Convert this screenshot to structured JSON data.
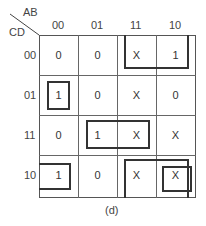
{
  "kmap": {
    "row_var": "CD",
    "col_var": "AB",
    "col_labels": [
      "00",
      "01",
      "11",
      "10"
    ],
    "row_labels": [
      "00",
      "01",
      "11",
      "10"
    ],
    "cells": [
      [
        "0",
        "0",
        "X",
        "1"
      ],
      [
        "1",
        "0",
        "X",
        "0"
      ],
      [
        "0",
        "1",
        "X",
        "X"
      ],
      [
        "1",
        "0",
        "X",
        "X"
      ]
    ],
    "groups": [
      {
        "name": "top-right-pair",
        "cells": [
          [
            0,
            2
          ],
          [
            0,
            3
          ]
        ]
      },
      {
        "name": "single-0001",
        "cells": [
          [
            1,
            0
          ]
        ]
      },
      {
        "name": "middle-pair",
        "cells": [
          [
            2,
            1
          ],
          [
            2,
            2
          ]
        ]
      },
      {
        "name": "wrap-left",
        "cells": [
          [
            3,
            0
          ]
        ]
      },
      {
        "name": "bottom-right-quad-wrap",
        "cells": [
          [
            3,
            2
          ],
          [
            3,
            3
          ]
        ]
      },
      {
        "name": "single-1010",
        "cells": [
          [
            3,
            3
          ]
        ]
      }
    ],
    "caption": "(d)"
  }
}
